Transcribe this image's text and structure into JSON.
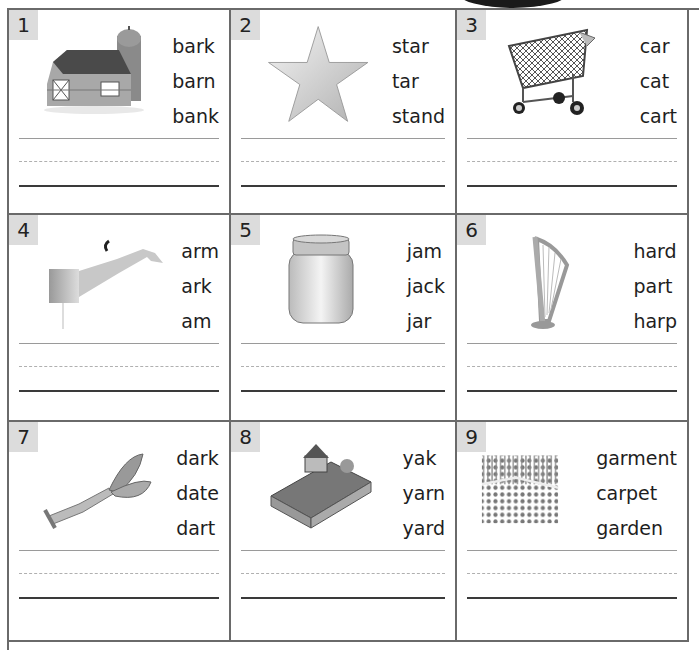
{
  "worksheet": {
    "cells": [
      {
        "number": "1",
        "picture": "barn",
        "words": [
          "bark",
          "barn",
          "bank"
        ]
      },
      {
        "number": "2",
        "picture": "star",
        "words": [
          "star",
          "tar",
          "stand"
        ]
      },
      {
        "number": "3",
        "picture": "shopping-cart",
        "words": [
          "car",
          "cat",
          "cart"
        ]
      },
      {
        "number": "4",
        "picture": "arm",
        "words": [
          "arm",
          "ark",
          "am"
        ]
      },
      {
        "number": "5",
        "picture": "jar",
        "words": [
          "jam",
          "jack",
          "jar"
        ]
      },
      {
        "number": "6",
        "picture": "harp",
        "words": [
          "hard",
          "part",
          "harp"
        ]
      },
      {
        "number": "7",
        "picture": "dart",
        "words": [
          "dark",
          "date",
          "dart"
        ]
      },
      {
        "number": "8",
        "picture": "yard",
        "words": [
          "yak",
          "yarn",
          "yard"
        ]
      },
      {
        "number": "9",
        "picture": "garden",
        "words": [
          "garment",
          "carpet",
          "garden"
        ]
      }
    ]
  }
}
